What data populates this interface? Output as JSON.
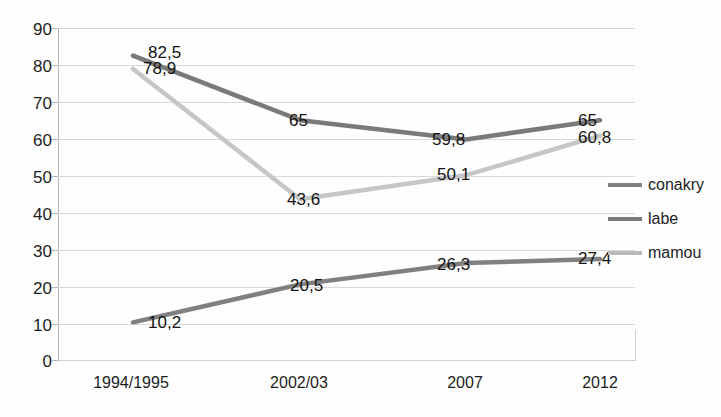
{
  "chart_data": {
    "type": "line",
    "title": "",
    "xlabel": "",
    "ylabel": "",
    "categories": [
      "1994/1995",
      "2002/03",
      "2007",
      "2012"
    ],
    "ylim": [
      0,
      90
    ],
    "y_ticks": [
      "0",
      "10",
      "20",
      "30",
      "40",
      "50",
      "60",
      "70",
      "80",
      "90"
    ],
    "grid": true,
    "legend_position": "right",
    "decimal_separator": ",",
    "series": [
      {
        "name": "conakry",
        "color": "#808080",
        "values": [
          10.2,
          20.5,
          26.3,
          27.4
        ],
        "labels": [
          "10,2",
          "20,5",
          "26,3",
          "27,4"
        ]
      },
      {
        "name": "labe",
        "color": "#7a7a7a",
        "values": [
          82.5,
          65,
          59.8,
          65
        ],
        "labels": [
          "82,5",
          "65",
          "59,8",
          "65"
        ]
      },
      {
        "name": "mamou",
        "color": "#c6c6c6",
        "values": [
          78.9,
          43.6,
          50.1,
          60.8
        ],
        "labels": [
          "78,9",
          "43,6",
          "50,1",
          "60,8"
        ]
      }
    ]
  },
  "axis": {
    "y_ticks": {
      "t90": "90",
      "t80": "80",
      "t70": "70",
      "t60": "60",
      "t50": "50",
      "t40": "40",
      "t30": "30",
      "t20": "20",
      "t10": "10",
      "t0": "0"
    },
    "x_ticks": {
      "c0": "1994/1995",
      "c1": "2002/03",
      "c2": "2007",
      "c3": "2012"
    }
  },
  "legend": {
    "items": [
      {
        "label": "conakry",
        "color": "#808080"
      },
      {
        "label": "labe",
        "color": "#7a7a7a"
      },
      {
        "label": "mamou",
        "color": "#b9b9b9"
      }
    ]
  },
  "data_labels": {
    "labe_1994": "82,5",
    "mamou_1994": "78,9",
    "labe_2002": "65",
    "mamou_2002": "43,6",
    "labe_2007": "59,8",
    "mamou_2007": "50,1",
    "labe_2012": "65",
    "mamou_2012": "60,8",
    "conakry_1994": "10,2",
    "conakry_2002": "20,5",
    "conakry_2007": "26,3",
    "conakry_2012": "27,4"
  }
}
